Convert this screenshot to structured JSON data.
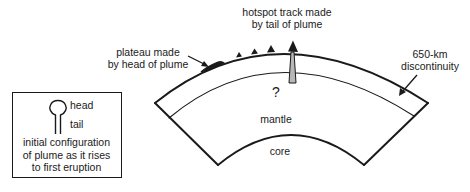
{
  "diagram": {
    "labels": {
      "hotspot_track": [
        "hotspot track made",
        "by tail of plume"
      ],
      "plateau": [
        "plateau made",
        "by head of plume"
      ],
      "discontinuity": [
        "650-km",
        "discontinuity"
      ],
      "question_mark": "?",
      "mantle": "mantle",
      "core": "core"
    },
    "legend": {
      "head_label": "head",
      "tail_label": "tail",
      "caption": [
        "initial configuration",
        "of plume as it rises",
        "to first eruption"
      ]
    },
    "colors": {
      "line": "#1a1a1a",
      "plume_tail_fill": "#b8b8b8",
      "background": "#ffffff"
    }
  }
}
